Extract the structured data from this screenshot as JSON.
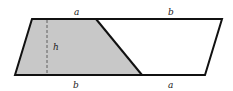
{
  "diagram": {
    "type": "geometry",
    "colors": {
      "shade": "#c8c8c8",
      "stroke": "#111111",
      "background": "#ffffff"
    },
    "labels": {
      "top_left": "a",
      "top_right": "b",
      "bottom_left": "b",
      "bottom_right": "a",
      "height": "h"
    }
  }
}
